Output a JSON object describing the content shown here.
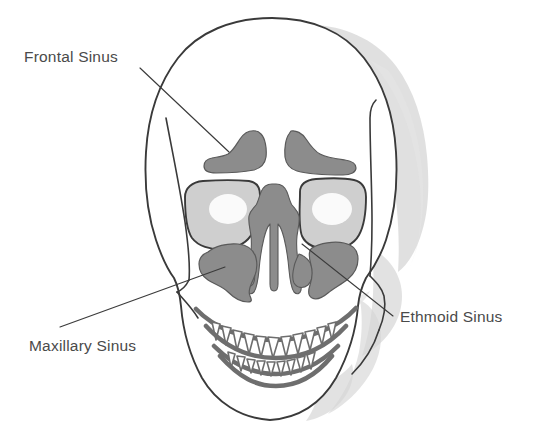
{
  "figure": {
    "background_color": "#ffffff",
    "width": 540,
    "height": 447
  },
  "colors": {
    "outline": "#3a3a3a",
    "sinus_fill": "#8c8c8c",
    "sinus_stroke": "#5a5a5a",
    "bone_shade": "#d5d5d5",
    "orbit_fill": "#cfcfcf",
    "label_text": "#4a4a4a",
    "leader_line": "#3b3b3b",
    "tooth_fill": "#ffffff",
    "jaw_stroke": "#6e6e6e"
  },
  "labels": [
    {
      "id": "frontal-sinus",
      "text": "Frontal Sinus",
      "text_x": 24,
      "text_y": 62,
      "anchor": "start",
      "leader_from_x": 140,
      "leader_from_y": 68,
      "leader_to_x": 229,
      "leader_to_y": 152,
      "target": "frontal sinus cavity above the left orbit"
    },
    {
      "id": "maxillary-sinus",
      "text": "Maxillary Sinus",
      "text_x": 29,
      "text_y": 351,
      "anchor": "start",
      "leader_from_x": 60,
      "leader_from_y": 327,
      "leader_to_x": 225,
      "leader_to_y": 267,
      "target": "maxillary sinus cavity left of the nasal aperture"
    },
    {
      "id": "ethmoid-sinus",
      "text": "Ethmoid Sinus",
      "text_x": 400,
      "text_y": 322,
      "anchor": "start",
      "leader_from_x": 302,
      "leader_from_y": 244,
      "leader_to_x": 393,
      "leader_to_y": 316,
      "target": "ethmoid air cells beside the nasal septum"
    }
  ],
  "anatomy": {
    "structures": [
      "cranium",
      "frontal bone",
      "temporal line",
      "left orbit",
      "right orbit",
      "frontal sinus left",
      "frontal sinus right",
      "ethmoid sinus / nasal cavity",
      "nasal septum",
      "maxillary sinus left",
      "maxillary sinus right",
      "maxilla",
      "mandible",
      "upper teeth",
      "lower teeth",
      "zygomatic arch left",
      "zygomatic arch right"
    ]
  }
}
